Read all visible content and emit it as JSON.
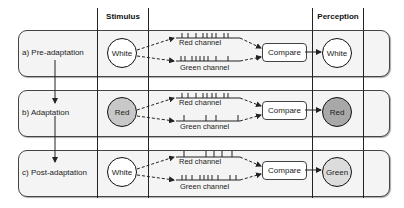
{
  "headers": {
    "stimulus": "Stimulus",
    "perception": "Perception"
  },
  "rows": [
    {
      "label": "a) Pre-adaptation",
      "stimulus": "White",
      "stimulus_fill": "#ffffff",
      "red_channel": "Red channel",
      "green_channel": "Green channel",
      "compare": "Compare",
      "perception": "White",
      "perception_fill": "#ffffff"
    },
    {
      "label": "b) Adaptation",
      "stimulus": "Red",
      "stimulus_fill": "#c8c8c8",
      "red_channel": "Red channel",
      "green_channel": "Green channel",
      "compare": "Compare",
      "perception": "Red",
      "perception_fill": "#a8a8a8"
    },
    {
      "label": "c) Post-adaptation",
      "stimulus": "White",
      "stimulus_fill": "#ffffff",
      "red_channel": "Red channel",
      "green_channel": "Green channel",
      "compare": "Compare",
      "perception": "Green",
      "perception_fill": "#dcdcdc"
    }
  ],
  "colors": {
    "line": "#222222",
    "box_bg": "#f4f4f4"
  }
}
